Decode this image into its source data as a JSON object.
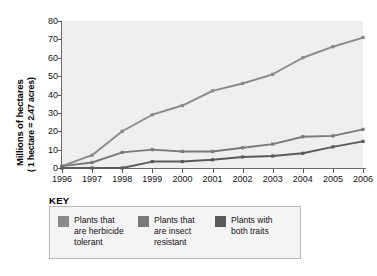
{
  "axis": {
    "ylabel_line1": "Millions of hectares",
    "ylabel_line2": "( 1 hectare = 2.47 acres)",
    "yticks": [
      "0",
      "10",
      "20",
      "30",
      "40",
      "50",
      "60",
      "70",
      "80"
    ],
    "xticks": [
      "1996",
      "1997",
      "1998",
      "1999",
      "2000",
      "2001",
      "2002",
      "2003",
      "2004",
      "2005",
      "2006"
    ]
  },
  "key": {
    "title": "KEY",
    "items": [
      {
        "label": "Plants that\nare herbicide\ntolerant",
        "color": "#8a8a8a"
      },
      {
        "label": "Plants that\nare insect\nresistant",
        "color": "#7a7a7a"
      },
      {
        "label": "Plants with\nboth traits",
        "color": "#5a5a5a"
      }
    ]
  },
  "chart_data": {
    "type": "line",
    "title": "",
    "xlabel": "",
    "ylabel": "Millions of hectares (1 hectare = 2.47 acres)",
    "x": [
      1996,
      1997,
      1998,
      1999,
      2000,
      2001,
      2002,
      2003,
      2004,
      2005,
      2006
    ],
    "categories": [
      "1996",
      "1997",
      "1998",
      "1999",
      "2000",
      "2001",
      "2002",
      "2003",
      "2004",
      "2005",
      "2006"
    ],
    "ylim": [
      0,
      80
    ],
    "xlim": [
      1996,
      2006
    ],
    "ytick_step": 10,
    "grid": false,
    "legend_position": "below-plot",
    "series": [
      {
        "name": "Plants that are herbicide tolerant",
        "color": "#8a8a8a",
        "values": [
          1,
          7,
          20,
          29,
          34,
          42,
          46,
          51,
          60,
          66,
          71
        ]
      },
      {
        "name": "Plants that are insect resistant",
        "color": "#7a7a7a",
        "values": [
          1,
          3,
          8.5,
          10,
          9,
          9,
          11,
          13,
          17,
          17.5,
          21
        ]
      },
      {
        "name": "Plants with both traits",
        "color": "#5a5a5a",
        "values": [
          0,
          0,
          0,
          3.5,
          3.5,
          4.5,
          6,
          6.5,
          8,
          11.5,
          14.5
        ]
      }
    ]
  }
}
